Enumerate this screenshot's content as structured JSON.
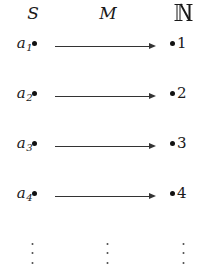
{
  "figure": {
    "type": "mapping-diagram",
    "background_color": "#ffffff",
    "ink_color": "#1a1a1a"
  },
  "columns": {
    "source": {
      "label": "S",
      "style": "math-italic"
    },
    "map": {
      "label": "M",
      "style": "math-italic"
    },
    "target": {
      "label": "ℕ",
      "style": "blackboard-bold"
    }
  },
  "rows": [
    {
      "source_symbol": "a",
      "source_subscript": "1",
      "arrow": "arrow-right",
      "target_label": "1"
    },
    {
      "source_symbol": "a",
      "source_subscript": "2",
      "arrow": "arrow-right",
      "target_label": "2"
    },
    {
      "source_symbol": "a",
      "source_subscript": "3",
      "arrow": "arrow-right",
      "target_label": "3"
    },
    {
      "source_symbol": "a",
      "source_subscript": "4",
      "arrow": "arrow-right",
      "target_label": "4"
    }
  ],
  "ellipsis": {
    "glyph": "⋮",
    "columns": [
      "source",
      "map",
      "target"
    ]
  }
}
